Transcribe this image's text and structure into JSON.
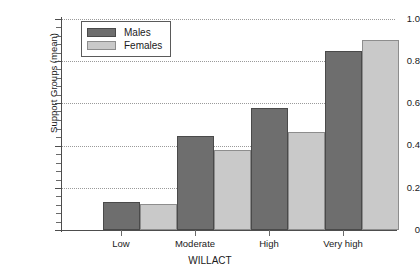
{
  "chart_data": {
    "type": "bar",
    "title": "",
    "xlabel": "WILLACT",
    "ylabel": "Support Groups (mean)",
    "categories": [
      "Low",
      "Moderate",
      "High",
      "Very high"
    ],
    "series": [
      {
        "name": "Males",
        "color": "#6e6e6e",
        "values": [
          0.135,
          0.445,
          0.58,
          0.85
        ]
      },
      {
        "name": "Females",
        "color": "#c9c9c9",
        "values": [
          0.125,
          0.38,
          0.465,
          0.9
        ]
      }
    ],
    "ylim": [
      0,
      1.0
    ],
    "yticks": [
      0,
      0.2,
      0.4,
      0.6,
      0.8,
      1.0
    ],
    "ytick_labels": [
      "0",
      "0.2",
      "0.4",
      "0.6",
      "0.8",
      "1.0"
    ],
    "minor_ticks_per_interval": 4,
    "grid": true,
    "grid_style": "dotted",
    "legend_position": "top-left"
  }
}
